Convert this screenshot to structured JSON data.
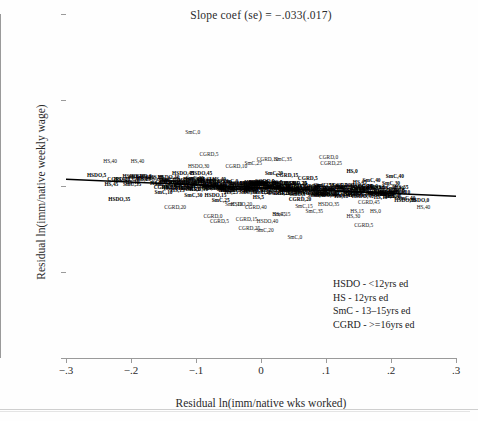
{
  "chart_data": {
    "type": "scatter",
    "title": "Slope coef (se) = −.033(.017)",
    "xlabel": "Residual ln(imm/native wks worked)",
    "ylabel": "Residual ln(imm/native weekly wage)",
    "xlim": [
      -0.3,
      0.3
    ],
    "ylim": [
      -0.2,
      0.2
    ],
    "xticks": [
      "−.3",
      "−.2",
      "−.1",
      "0",
      ".1",
      ".2",
      ".3"
    ],
    "xtick_values": [
      -0.3,
      -0.2,
      -0.1,
      0,
      0.1,
      0.2,
      0.3
    ],
    "yticks": [
      ".2",
      ".1",
      "0",
      "−.1",
      "−.2"
    ],
    "ytick_values": [
      0.2,
      0.1,
      0,
      -0.1,
      -0.2
    ],
    "grid": false,
    "legend_position": "bottom-right",
    "fit_line": {
      "slope": -0.033,
      "se": 0.017,
      "intercept": -0.002
    },
    "marker_style": "text-label",
    "label_format": "GROUP,AGE",
    "points": [
      {
        "label": "HS,40",
        "x": -0.232,
        "y": 0.028
      },
      {
        "label": "HS,40",
        "x": -0.19,
        "y": 0.028
      },
      {
        "label": "HSDO,5",
        "x": -0.253,
        "y": 0.012
      },
      {
        "label": "HSDO,10",
        "x": -0.196,
        "y": 0.01
      },
      {
        "label": "HSDO,35",
        "x": -0.218,
        "y": -0.016
      },
      {
        "label": "SmC,0",
        "x": -0.105,
        "y": 0.062
      },
      {
        "label": "CGRD,5",
        "x": -0.08,
        "y": 0.036
      },
      {
        "label": "HSDO,30",
        "x": -0.096,
        "y": 0.022
      },
      {
        "label": "CGRD,10",
        "x": -0.038,
        "y": 0.022
      },
      {
        "label": "HSDO,45",
        "x": -0.12,
        "y": 0.014
      },
      {
        "label": "HSDO,45",
        "x": -0.092,
        "y": 0.014
      },
      {
        "label": "HSDO,0",
        "x": -0.112,
        "y": 0.006
      },
      {
        "label": "HS,10",
        "x": -0.082,
        "y": 0.006
      },
      {
        "label": "HS,15",
        "x": -0.128,
        "y": -0.006
      },
      {
        "label": "SmC,30",
        "x": -0.104,
        "y": -0.012
      },
      {
        "label": "HSDO,15",
        "x": -0.07,
        "y": -0.012
      },
      {
        "label": "SmC,25",
        "x": -0.062,
        "y": -0.018
      },
      {
        "label": "CGRD,0",
        "x": -0.074,
        "y": -0.036
      },
      {
        "label": "CGRD,5",
        "x": -0.064,
        "y": -0.042
      },
      {
        "label": "CGRD,15",
        "x": -0.022,
        "y": -0.04
      },
      {
        "label": "HSDO,40",
        "x": 0.01,
        "y": -0.042
      },
      {
        "label": "CGRD,25",
        "x": -0.018,
        "y": -0.05
      },
      {
        "label": "SmC,20",
        "x": 0.006,
        "y": -0.052
      },
      {
        "label": "SmC,0",
        "x": 0.052,
        "y": -0.06
      },
      {
        "label": "CGRD,10",
        "x": 0.01,
        "y": 0.03
      },
      {
        "label": "SmC,25",
        "x": -0.012,
        "y": 0.026
      },
      {
        "label": "SmC,35",
        "x": 0.034,
        "y": 0.03
      },
      {
        "label": "CGRD,0",
        "x": 0.104,
        "y": 0.032
      },
      {
        "label": "CGRD,25",
        "x": 0.108,
        "y": 0.026
      },
      {
        "label": "SmC,20",
        "x": 0.02,
        "y": 0.014
      },
      {
        "label": "CGRD,15",
        "x": 0.04,
        "y": 0.012
      },
      {
        "label": "HS,0",
        "x": 0.14,
        "y": 0.016
      },
      {
        "label": "CGRD,5",
        "x": 0.072,
        "y": 0.008
      },
      {
        "label": "HS,45",
        "x": 0.152,
        "y": 0.004
      },
      {
        "label": "SmC,40",
        "x": 0.17,
        "y": 0.006
      },
      {
        "label": "HSDO,30",
        "x": 0.196,
        "y": -0.008
      },
      {
        "label": "HSDO,0",
        "x": 0.244,
        "y": -0.018
      },
      {
        "label": "HSDO,10",
        "x": 0.222,
        "y": -0.018
      },
      {
        "label": "HS,40",
        "x": 0.25,
        "y": -0.026
      },
      {
        "label": "HS,15",
        "x": 0.148,
        "y": -0.03
      },
      {
        "label": "HS,0",
        "x": 0.176,
        "y": -0.03
      },
      {
        "label": "HS,30",
        "x": 0.142,
        "y": -0.036
      },
      {
        "label": "CGRD,5",
        "x": 0.158,
        "y": -0.046
      },
      {
        "label": "HS,45",
        "x": 0.028,
        "y": -0.034
      },
      {
        "label": "SmC,15",
        "x": 0.032,
        "y": -0.034
      },
      {
        "label": "HSDO,20",
        "x": -0.03,
        "y": -0.022
      },
      {
        "label": "SmC,10",
        "x": -0.042,
        "y": -0.022
      },
      {
        "label": "HS,35",
        "x": -0.058,
        "y": -0.002
      },
      {
        "label": "CGRD,20",
        "x": 0.06,
        "y": -0.016
      },
      {
        "label": "SmC,45",
        "x": 0.086,
        "y": -0.012
      },
      {
        "label": "HS,20",
        "x": 0.0,
        "y": -0.002
      },
      {
        "label": "SmC,5",
        "x": -0.016,
        "y": 0.0
      },
      {
        "label": "CGRD,30",
        "x": 0.024,
        "y": -0.004
      },
      {
        "label": "HSDO,25",
        "x": 0.048,
        "y": -0.006
      },
      {
        "label": "HS,25",
        "x": -0.046,
        "y": -0.008
      },
      {
        "label": "SmC,15",
        "x": 0.066,
        "y": -0.024
      },
      {
        "label": "CGRD,35",
        "x": 0.094,
        "y": -0.004
      },
      {
        "label": "HSDO,20",
        "x": 0.118,
        "y": -0.01
      },
      {
        "label": "SmC,5",
        "x": 0.128,
        "y": -0.002
      },
      {
        "label": "HS,5",
        "x": -0.004,
        "y": -0.014
      },
      {
        "label": "CGRD,40",
        "x": -0.008,
        "y": -0.026
      },
      {
        "label": "SmC,35",
        "x": 0.082,
        "y": -0.03
      },
      {
        "label": "HSDO,35",
        "x": 0.104,
        "y": -0.022
      },
      {
        "label": "HS,10",
        "x": 0.184,
        "y": -0.014
      },
      {
        "label": "CGRD,45",
        "x": 0.166,
        "y": -0.02
      },
      {
        "label": "SmC,30",
        "x": 0.2,
        "y": 0.002
      },
      {
        "label": "HSDO,15",
        "x": -0.14,
        "y": 0.004
      },
      {
        "label": "SmC,10",
        "x": -0.15,
        "y": -0.008
      },
      {
        "label": "HS,5",
        "x": -0.162,
        "y": 0.002
      },
      {
        "label": "CGRD,20",
        "x": -0.132,
        "y": -0.026
      },
      {
        "label": "SmC,40",
        "x": 0.206,
        "y": 0.01
      },
      {
        "label": "HS,35",
        "x": 0.216,
        "y": -0.002
      }
    ]
  },
  "legend": {
    "items": [
      "HSDO - <12yrs ed",
      "HS - 12yrs ed",
      "SmC - 13–15yrs ed",
      "CGRD - >=16yrs ed"
    ]
  }
}
